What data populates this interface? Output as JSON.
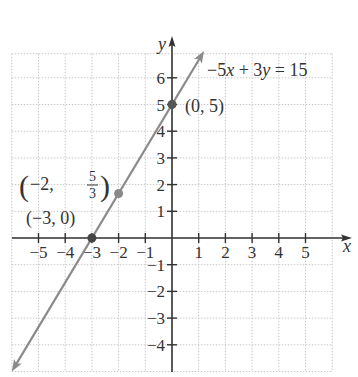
{
  "chart_data": {
    "type": "line",
    "title": "",
    "xlabel": "x",
    "ylabel": "y",
    "xlim": [
      -6,
      6
    ],
    "ylim": [
      -5,
      7
    ],
    "grid": true,
    "x_ticks": [
      -5,
      -4,
      -3,
      -2,
      -1,
      1,
      2,
      3,
      4,
      5
    ],
    "y_ticks": [
      -4,
      -3,
      -2,
      -1,
      1,
      2,
      3,
      4,
      5,
      6
    ],
    "x_tick_labels": [
      "−5",
      "−4",
      "−3",
      "−2",
      "−1",
      "1",
      "2",
      "3",
      "4",
      "5"
    ],
    "y_tick_labels": [
      "−4",
      "−3",
      "−2",
      "−1",
      "1",
      "2",
      "3",
      "4",
      "5",
      "6"
    ],
    "series": [
      {
        "name": "−5x + 3y = 15",
        "equation": "-5x + 3y = 15",
        "slope": 1.6667,
        "intercept": 5,
        "x": [
          -6,
          1.2
        ],
        "y": [
          -5,
          7
        ],
        "color": "#8a8a8a",
        "arrows": "both"
      }
    ],
    "points": [
      {
        "x": -3,
        "y": 0,
        "label": "(−3, 0)",
        "color": "#444444"
      },
      {
        "x": -2,
        "y": 1.6667,
        "label": "(−2, 5/3)",
        "color": "#8a8a8a"
      },
      {
        "x": 0,
        "y": 5,
        "label": "(0, 5)",
        "color": "#555555"
      }
    ],
    "annotations": [
      {
        "text": "−5x + 3y = 15",
        "position": "upper right of line"
      },
      {
        "text": "(0, 5)"
      },
      {
        "text": "(−2, 5/3)"
      },
      {
        "text": "(−3, 0)"
      }
    ]
  },
  "labels": {
    "x_axis": "x",
    "y_axis": "y",
    "equation": {
      "prefix": "−5",
      "var1": "x",
      "mid": " + 3",
      "var2": "y",
      "suffix": " = 15"
    },
    "point_0_5": "(0, 5)",
    "point_m3_0": "(−3, 0)",
    "point_m2_prefix": "−2,",
    "point_m2_num": "5",
    "point_m2_den": "3"
  },
  "colors": {
    "axis": "#333333",
    "grid": "#c8c8c8",
    "line": "#8a8a8a",
    "text": "#333333"
  }
}
